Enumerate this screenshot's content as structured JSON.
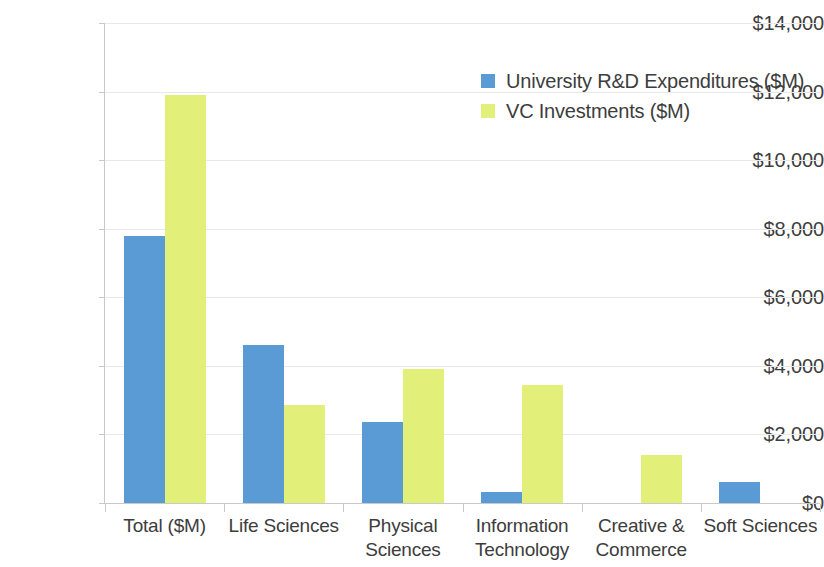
{
  "chart_data": {
    "type": "bar",
    "title": "",
    "subtitle": "",
    "xlabel": "",
    "ylabel": "",
    "categories": [
      "Total ($M)",
      "Life Sciences",
      "Physical Sciences",
      "Information Technology",
      "Creative & Commerce",
      "Soft Sciences"
    ],
    "series": [
      {
        "name": "University R&D Expenditures ($M)",
        "color": "#5B9BD5",
        "values": [
          7800,
          4600,
          2350,
          330,
          null,
          620
        ]
      },
      {
        "name": "VC Investments ($M)",
        "color": "#E2F07A",
        "values": [
          11900,
          2850,
          3900,
          3450,
          1400,
          null
        ]
      }
    ],
    "ylim": [
      0,
      14000
    ],
    "ytick_step": 2000,
    "ytick_labels": [
      "$0",
      "$2,000",
      "$4,000",
      "$6,000",
      "$8,000",
      "$10,000",
      "$12,000",
      "$14,000"
    ],
    "ytick_values": [
      0,
      2000,
      4000,
      6000,
      8000,
      10000,
      12000,
      14000
    ],
    "grid": true,
    "grid_axis": "y",
    "legend": true,
    "legend_position": "top-right",
    "legend_entries": [
      "University R&D Expenditures ($M)",
      "VC Investments ($M)"
    ],
    "axis_color": "#c9c9c9",
    "grid_color": "#e8e8e8",
    "text_color": "#3d3d3d",
    "background": "#ffffff"
  }
}
